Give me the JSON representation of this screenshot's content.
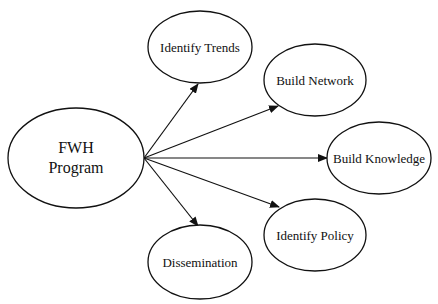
{
  "diagram": {
    "type": "hub-and-spoke",
    "stroke_color": "#111111",
    "background": "#ffffff",
    "hub": {
      "id": "fwh",
      "line1": "FWH",
      "line2": "Program",
      "cx": 76,
      "cy": 158,
      "rx": 68,
      "ry": 50
    },
    "nodes": [
      {
        "id": "identify-trends",
        "label": "Identify Trends",
        "cx": 200,
        "cy": 47,
        "rx": 52,
        "ry": 36,
        "tip": [
          198,
          84
        ]
      },
      {
        "id": "build-network",
        "label": "Build Network",
        "cx": 315,
        "cy": 80,
        "rx": 51,
        "ry": 36,
        "tip": [
          278,
          106
        ]
      },
      {
        "id": "build-knowledge",
        "label": "Build Knowledge",
        "cx": 379,
        "cy": 158,
        "rx": 52,
        "ry": 36,
        "tip": [
          327,
          158
        ]
      },
      {
        "id": "identify-policy",
        "label": "Identify Policy",
        "cx": 315,
        "cy": 235,
        "rx": 51,
        "ry": 36,
        "tip": [
          279,
          207
        ]
      },
      {
        "id": "dissemination",
        "label": "Dissemination",
        "cx": 200,
        "cy": 262,
        "rx": 52,
        "ry": 37,
        "tip": [
          198,
          226
        ]
      }
    ],
    "edge_origin": [
      144,
      158
    ]
  }
}
